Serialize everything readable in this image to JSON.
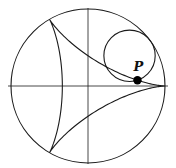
{
  "figure": {
    "type": "deltoid-hypocycloid",
    "colors": {
      "stroke": "#1a1a1a",
      "point": "#000000",
      "background": "#ffffff"
    },
    "fixed_circle": {
      "cx": 88,
      "cy": 86,
      "r": 77
    },
    "axes": {
      "horizontal": {
        "x1": 8,
        "x2": 168,
        "y": 86
      },
      "vertical": {
        "x": 88,
        "y1": 8,
        "y2": 164
      }
    },
    "rolling_circle": {
      "radius_ratio": 0.3333,
      "angle_deg": 36
    },
    "deltoid": {
      "cusps": 3,
      "samples": 240
    },
    "point": {
      "label": "P",
      "radius": 4.2,
      "label_dx": -4,
      "label_dy": -9
    }
  }
}
